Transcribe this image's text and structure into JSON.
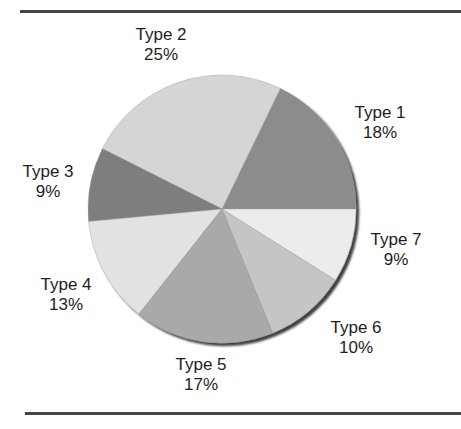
{
  "chart_data": {
    "type": "pie",
    "title": "",
    "categories": [
      "Type 1",
      "Type 2",
      "Type 3",
      "Type 4",
      "Type 5",
      "Type 6",
      "Type 7"
    ],
    "values": [
      18,
      25,
      9,
      13,
      17,
      10,
      9
    ],
    "value_labels": [
      "18%",
      "25%",
      "9%",
      "13%",
      "17%",
      "10%",
      "9%"
    ],
    "start_angle_deg": 0,
    "direction": "counterclockwise",
    "colors": [
      "#8c8c8c",
      "#d5d5d5",
      "#7e7e7e",
      "#e2e2e2",
      "#a9a9a9",
      "#c5c5c5",
      "#ececec"
    ],
    "legend": "none",
    "shadow": true
  },
  "labels": [
    {
      "name": "Type 1",
      "pct": "18%",
      "x": 380,
      "y": 103
    },
    {
      "name": "Type 2",
      "pct": "25%",
      "x": 161,
      "y": 25
    },
    {
      "name": "Type 3",
      "pct": "9%",
      "x": 48,
      "y": 162
    },
    {
      "name": "Type 4",
      "pct": "13%",
      "x": 66,
      "y": 275
    },
    {
      "name": "Type 5",
      "pct": "17%",
      "x": 201,
      "y": 355
    },
    {
      "name": "Type 6",
      "pct": "10%",
      "x": 356,
      "y": 318
    },
    {
      "name": "Type 7",
      "pct": "9%",
      "x": 396,
      "y": 230
    }
  ],
  "pie": {
    "cx": 222,
    "cy": 209,
    "r": 134
  }
}
